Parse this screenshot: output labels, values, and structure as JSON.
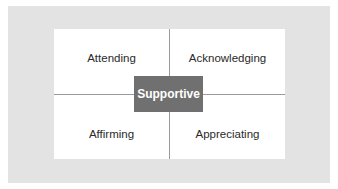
{
  "diagram": {
    "center": "Supportive",
    "quadrants": {
      "top_left": "Attending",
      "top_right": "Acknowledging",
      "bottom_left": "Affirming",
      "bottom_right": "Appreciating"
    },
    "colors": {
      "frame": "#e3e3e3",
      "panel": "#ffffff",
      "center_box": "#707070",
      "center_text": "#ffffff",
      "divider": "#9a9a9a"
    }
  }
}
